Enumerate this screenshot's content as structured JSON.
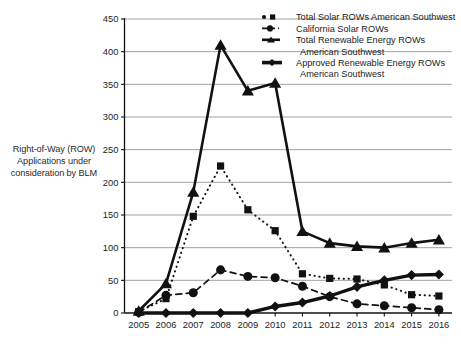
{
  "chart_data": {
    "type": "line",
    "title": "",
    "subtitle": "",
    "ylabel": "Right-of-Way (ROW) Applications under consideration by BLM",
    "xlabel": "",
    "grid": true,
    "legend_position": "top-right",
    "ylim": [
      0,
      450
    ],
    "ytick_step": 50,
    "yticks": [
      "0",
      "50",
      "100",
      "150",
      "200",
      "250",
      "300",
      "350",
      "400",
      "450"
    ],
    "categories": [
      "2005",
      "2006",
      "2007",
      "2008",
      "2009",
      "2010",
      "2011",
      "2012",
      "2013",
      "2014",
      "2015",
      "2016"
    ],
    "x": [
      2005,
      2006,
      2007,
      2008,
      2009,
      2010,
      2011,
      2012,
      2013,
      2014,
      2015,
      2016
    ],
    "series": [
      {
        "name": "Total Solar ROWs American Southwest",
        "marker": "square",
        "line_style": "dotted",
        "color": "#111111",
        "values": [
          2,
          22,
          148,
          225,
          158,
          126,
          60,
          53,
          52,
          43,
          28,
          26
        ]
      },
      {
        "name": "California Solar ROWs",
        "marker": "circle",
        "line_style": "dashed",
        "color": "#111111",
        "values": [
          1,
          27,
          31,
          66,
          56,
          54,
          41,
          25,
          14,
          11,
          8,
          5
        ]
      },
      {
        "name": "Total Renewable Energy ROWs American Southwest",
        "marker": "triangle",
        "line_style": "solid",
        "color": "#111111",
        "values": [
          3,
          45,
          185,
          410,
          340,
          352,
          125,
          107,
          102,
          100,
          107,
          112
        ]
      },
      {
        "name": "Approved Renewable Energy ROWs American Southwest",
        "marker": "diamond",
        "line_style": "solid-thick",
        "color": "#111111",
        "values": [
          0,
          0,
          0,
          0,
          0,
          10,
          16,
          26,
          40,
          50,
          58,
          59
        ]
      }
    ]
  },
  "legend": {
    "items": [
      {
        "label": "Total Solar ROWs American Southwest",
        "line2": ""
      },
      {
        "label": "California Solar ROWs",
        "line2": ""
      },
      {
        "label": "Total Renewable Energy ROWs",
        "line2": "American Southwest"
      },
      {
        "label": "Approved Renewable Energy ROWs",
        "line2": "American Southwest"
      }
    ]
  },
  "axis": {
    "y_title_line1": "Right-of-Way (ROW)",
    "y_title_line2": "Applications under",
    "y_title_line3": "consideration by BLM"
  }
}
